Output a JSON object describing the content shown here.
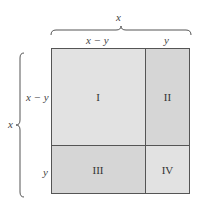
{
  "diagram": {
    "top_brace_label": "x",
    "left_brace_label": "x",
    "top_labels": {
      "left": "x − y",
      "right": "y"
    },
    "side_labels": {
      "top": "x − y",
      "bottom": "y"
    },
    "regions": [
      {
        "id": "I",
        "label": "I",
        "color": "#e2e2e2"
      },
      {
        "id": "II",
        "label": "II",
        "color": "#d6d6d6"
      },
      {
        "id": "III",
        "label": "III",
        "color": "#d6d6d6"
      },
      {
        "id": "IV",
        "label": "IV",
        "color": "#e2e2e2"
      }
    ],
    "line_color": "#555555"
  }
}
